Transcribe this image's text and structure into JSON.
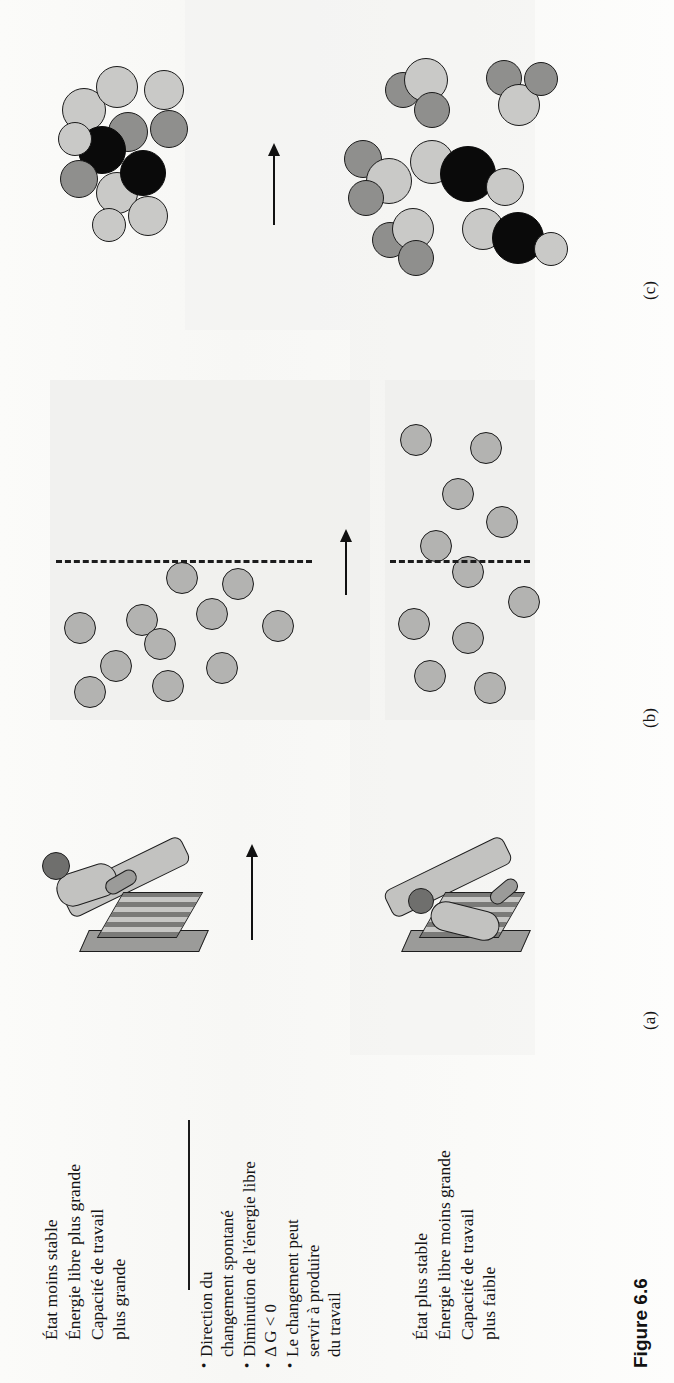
{
  "figure": {
    "caption": "Figure 6.6",
    "panels": [
      {
        "id": "a",
        "label": "(a)"
      },
      {
        "id": "b",
        "label": "(b)"
      },
      {
        "id": "c",
        "label": "(c)"
      }
    ]
  },
  "initial_state": {
    "lines": [
      "État moins stable",
      "Énergie libre plus grande",
      "Capacité de travail",
      "plus grande"
    ]
  },
  "final_state": {
    "lines": [
      "État plus stable",
      "Énergie libre moins grande",
      "Capacité de travail",
      "plus faible"
    ]
  },
  "middle_notes": {
    "bullets": [
      {
        "lines": [
          "Direction du",
          "changement spontané"
        ]
      },
      {
        "lines": [
          "Diminution de l'énergie libre"
        ]
      },
      {
        "lines": [
          "Δ G < 0"
        ]
      },
      {
        "lines": [
          "Le changement peut",
          "servir à produire",
          "du travail"
        ]
      }
    ]
  },
  "arrows": {
    "transition_arrow_name": "transition-arrow"
  },
  "colors": {
    "ink": "#141414",
    "panel_background": "#efefed",
    "atom_light": "#c9c9c7",
    "atom_mid": "#8f8f8d",
    "atom_dark": "#0a0a0a",
    "gas_particle": "#b3b3b1"
  }
}
